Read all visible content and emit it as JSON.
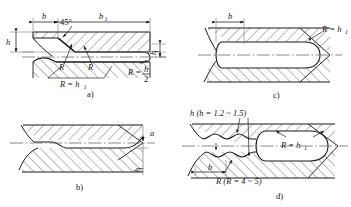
{
  "figure": {
    "title": "",
    "type": "engineering-cross-section-drawing",
    "stroke_color": "#1a1a1a",
    "hatch_color": "#3a3a3a",
    "center_line_color": "#555555",
    "background": "#ffffff"
  },
  "panels": [
    {
      "id": "a",
      "caption": "a)",
      "dimensions": [
        {
          "name": "b",
          "label": "b"
        },
        {
          "name": "b1",
          "label": "b",
          "sub": "1"
        },
        {
          "name": "h",
          "label": "h"
        },
        {
          "name": "h1",
          "label": "h",
          "sub": "1"
        }
      ],
      "annotations": [
        {
          "name": "angle",
          "label": "45°"
        },
        {
          "name": "radius-left",
          "label": "R"
        },
        {
          "name": "radius-right",
          "label": "R"
        },
        {
          "name": "radius-equals-h1",
          "label": "R = h",
          "sub": "1"
        },
        {
          "name": "radius-equals-h-over-2",
          "label": "R =",
          "num": "h",
          "den": "2"
        }
      ]
    },
    {
      "id": "b",
      "caption": "b)",
      "dimensions": [
        {
          "name": "a",
          "label": "a"
        },
        {
          "name": "h1",
          "label": "h",
          "sub": "1"
        }
      ],
      "annotations": []
    },
    {
      "id": "c",
      "caption": "c)",
      "dimensions": [
        {
          "name": "b",
          "label": "b"
        }
      ],
      "annotations": [
        {
          "name": "radius-equals-h1",
          "label": "R = h",
          "sub": "1"
        }
      ]
    },
    {
      "id": "d",
      "caption": "d)",
      "dimensions": [
        {
          "name": "b",
          "label": "b"
        }
      ],
      "annotations": [
        {
          "name": "h-range",
          "label": "h (h = 1.2 ~ 1.5)"
        },
        {
          "name": "r-range",
          "label": "R (R = 4 ~ 5)"
        },
        {
          "name": "radius-equals-h1",
          "label": "R = h",
          "sub": "1"
        }
      ]
    }
  ]
}
